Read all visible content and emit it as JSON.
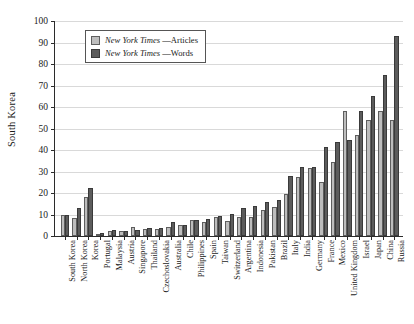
{
  "chart_data": {
    "type": "bar",
    "title": "",
    "xlabel": "",
    "ylabel": "South Korea",
    "ylim": [
      0,
      100
    ],
    "yticks": [
      0,
      10,
      20,
      30,
      40,
      50,
      60,
      70,
      80,
      90,
      100
    ],
    "grid": true,
    "legend_position": "top-left",
    "categories": [
      "South Korea",
      "North Korea",
      "Korea",
      "Portugal",
      "Malaysia",
      "Austria",
      "Singapore",
      "Thailand",
      "Czechoslovakia",
      "Australia",
      "Chile",
      "Philippines",
      "Spain",
      "Taiwan",
      "Switzerland",
      "Argentina",
      "Indonesia",
      "Pakistan",
      "Brazil",
      "Italy",
      "India",
      "Germany",
      "France",
      "Mexico",
      "United Kingdom",
      "Israel",
      "Japan",
      "China",
      "Russia"
    ],
    "series": [
      {
        "name": "New York Times —Articles",
        "name_italic": "New York Times",
        "name_roman": " —Articles",
        "color": "#bdbdbd",
        "values": [
          10,
          8.5,
          18,
          1,
          2.5,
          2.3,
          4,
          3.4,
          3.2,
          4.1,
          5,
          7.3,
          6.7,
          9,
          7,
          9,
          8.8,
          12.3,
          13.5,
          19.7,
          27.5,
          31.7,
          25.2,
          34.5,
          58,
          47,
          54,
          58,
          54
        ]
      },
      {
        "name": "New York Times —Words",
        "name_italic": "New York Times",
        "name_roman": " —Words",
        "color": "#5c5c5c",
        "values": [
          10,
          12.8,
          22.3,
          1.2,
          2.6,
          2.4,
          3,
          3.5,
          3.5,
          6.5,
          5.2,
          7.4,
          8,
          9.1,
          10.4,
          13,
          14,
          15.8,
          16.6,
          27.8,
          32,
          32.3,
          41.5,
          43.5,
          44.8,
          58,
          65.3,
          75,
          93
        ]
      }
    ]
  },
  "legend": {
    "items": [
      {
        "italic": "New York Times",
        "roman": " —Articles"
      },
      {
        "italic": "New York Times",
        "roman": " —Words"
      }
    ]
  }
}
